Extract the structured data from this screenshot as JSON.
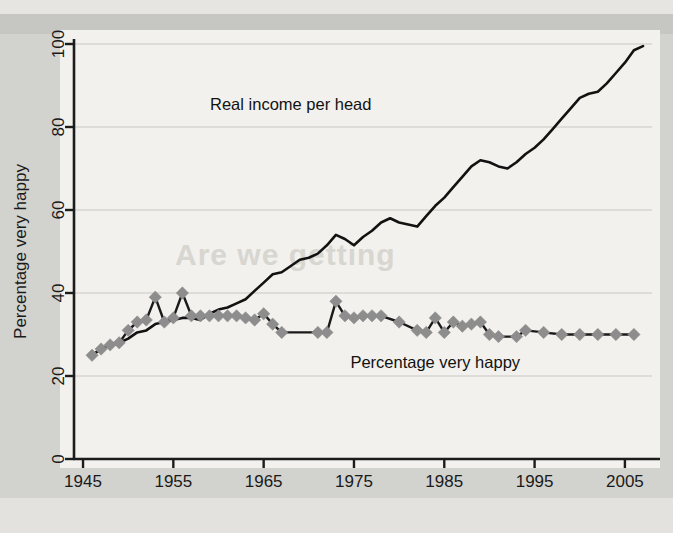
{
  "figure": {
    "background_color": "#d2d2ce",
    "plot_background_color": "#f2f1ed",
    "bleedthrough_text": "Are we getting"
  },
  "annotations": {
    "income_label": "Real income per head",
    "happy_label": "Percentage very happy"
  },
  "axis": {
    "y_title": "Percentage very happy",
    "y_ticks": [
      "0",
      "20",
      "40",
      "60",
      "80",
      "100"
    ],
    "x_ticks": [
      "1945",
      "1955",
      "1965",
      "1975",
      "1985",
      "1995",
      "2005"
    ]
  },
  "chart_data": {
    "type": "line",
    "title": "",
    "subtitle": "",
    "xlabel": "",
    "ylabel": "Percentage very happy",
    "xlim": [
      1944,
      2008
    ],
    "ylim": [
      0,
      100
    ],
    "grid": "horizontal",
    "legend": "inline-annotations",
    "x_tick_values": [
      1945,
      1955,
      1965,
      1975,
      1985,
      1995,
      2005
    ],
    "y_tick_values": [
      0,
      20,
      40,
      60,
      80,
      100
    ],
    "series": [
      {
        "name": "Real income per head",
        "color": "#121212",
        "marker": "none",
        "label_position": {
          "x": 1968,
          "y": 84
        },
        "x": [
          1946,
          1947,
          1948,
          1949,
          1950,
          1951,
          1952,
          1953,
          1954,
          1955,
          1956,
          1957,
          1958,
          1959,
          1960,
          1961,
          1962,
          1963,
          1964,
          1965,
          1966,
          1967,
          1968,
          1969,
          1970,
          1971,
          1972,
          1973,
          1974,
          1975,
          1976,
          1977,
          1978,
          1979,
          1980,
          1981,
          1982,
          1983,
          1984,
          1985,
          1986,
          1987,
          1988,
          1989,
          1990,
          1991,
          1992,
          1993,
          1994,
          1995,
          1996,
          1997,
          1998,
          1999,
          2000,
          2001,
          2002,
          2003,
          2004,
          2005,
          2006,
          2007
        ],
        "y": [
          25,
          26.5,
          27.5,
          28,
          29,
          30.5,
          31,
          32.5,
          33,
          33.5,
          34,
          34,
          33.5,
          35,
          36,
          36.5,
          37.5,
          38.5,
          40.5,
          42.5,
          44.5,
          45,
          46.5,
          48,
          48.5,
          49.5,
          51.5,
          54,
          53,
          51.5,
          53.5,
          55,
          57,
          58,
          57,
          56.5,
          56,
          58.5,
          61,
          63,
          65.5,
          68,
          70.5,
          72,
          71.5,
          70.5,
          70,
          71.5,
          73.5,
          75,
          77,
          79.5,
          82,
          84.5,
          87,
          88,
          88.5,
          90.5,
          93,
          95.5,
          98.5,
          99.5
        ]
      },
      {
        "name": "Percentage very happy",
        "color": "#1a1a1a",
        "marker": "diamond",
        "marker_color": "#8d8d8d",
        "label_position": {
          "x": 1984,
          "y": 22
        },
        "x": [
          1946,
          1947,
          1948,
          1949,
          1950,
          1951,
          1952,
          1953,
          1954,
          1955,
          1956,
          1957,
          1958,
          1959,
          1960,
          1961,
          1962,
          1963,
          1964,
          1965,
          1966,
          1967,
          1971,
          1972,
          1973,
          1974,
          1975,
          1976,
          1977,
          1978,
          1980,
          1982,
          1983,
          1984,
          1985,
          1986,
          1987,
          1988,
          1989,
          1990,
          1991,
          1993,
          1994,
          1996,
          1998,
          2000,
          2002,
          2004,
          2006
        ],
        "y": [
          25,
          26.5,
          27.5,
          28,
          31,
          33,
          33.5,
          39,
          33,
          34,
          40,
          34.5,
          34.5,
          34.5,
          34.5,
          34.5,
          34.5,
          34,
          33.5,
          35,
          32.5,
          30.5,
          30.5,
          30.5,
          38,
          34.5,
          34,
          34.5,
          34.5,
          34.5,
          33,
          31,
          30.5,
          34,
          30.5,
          33,
          32,
          32.5,
          33,
          30,
          29.5,
          29.5,
          31,
          30.5,
          30,
          30,
          30,
          30,
          30
        ]
      }
    ]
  }
}
